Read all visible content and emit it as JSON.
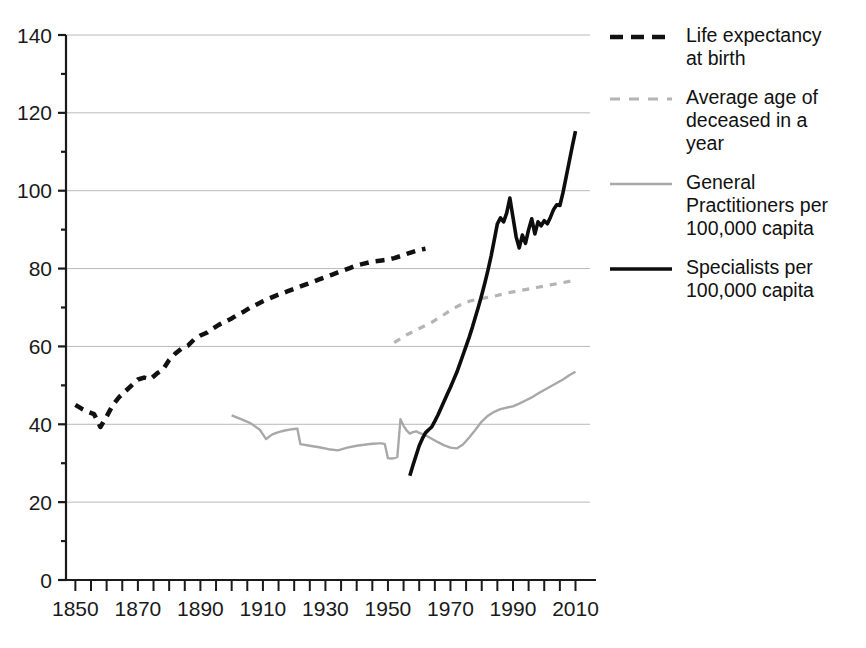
{
  "chart_data": {
    "type": "line",
    "title": "",
    "xlabel": "",
    "ylabel": "",
    "xlim": [
      1847,
      2014
    ],
    "ylim": [
      0,
      140
    ],
    "ytick_step": 20,
    "xtick_major_step": 20,
    "xtick_minor_step": 5,
    "grid": true,
    "grid_axis": "y",
    "legend_position": "right",
    "yticks": [
      "0",
      "20",
      "40",
      "60",
      "80",
      "100",
      "120",
      "140"
    ],
    "xticks": [
      "1850",
      "1870",
      "1890",
      "1910",
      "1930",
      "1950",
      "1970",
      "1990",
      "2010"
    ],
    "colors": {
      "life_expectancy": "#111111",
      "average_age_deceased": "#b4b4b4",
      "general_practitioners": "#a8a8a8",
      "specialists": "#0d0d0d",
      "gridline": "#b9b9b9",
      "axis": "#1a1a1a"
    },
    "series": [
      {
        "name": "Life expectancy at birth",
        "style": "dashed",
        "color": "#111111",
        "width": 4.5,
        "points": [
          [
            1850,
            45.0
          ],
          [
            1852,
            44.0
          ],
          [
            1854,
            43.2
          ],
          [
            1856,
            42.6
          ],
          [
            1858,
            39.3
          ],
          [
            1860,
            42.0
          ],
          [
            1862,
            45.0
          ],
          [
            1864,
            47.0
          ],
          [
            1866,
            48.5
          ],
          [
            1868,
            50.0
          ],
          [
            1870,
            51.5
          ],
          [
            1872,
            52.0
          ],
          [
            1874,
            51.6
          ],
          [
            1876,
            53.0
          ],
          [
            1878,
            54.0
          ],
          [
            1880,
            56.5
          ],
          [
            1882,
            58.2
          ],
          [
            1884,
            59.5
          ],
          [
            1886,
            60.2
          ],
          [
            1888,
            61.8
          ],
          [
            1890,
            62.8
          ],
          [
            1892,
            63.5
          ],
          [
            1894,
            64.6
          ],
          [
            1896,
            65.6
          ],
          [
            1898,
            66.4
          ],
          [
            1900,
            67.2
          ],
          [
            1902,
            68.2
          ],
          [
            1904,
            69.0
          ],
          [
            1906,
            70.0
          ],
          [
            1908,
            70.8
          ],
          [
            1910,
            71.6
          ],
          [
            1912,
            72.3
          ],
          [
            1914,
            73.0
          ],
          [
            1916,
            73.6
          ],
          [
            1918,
            74.2
          ],
          [
            1920,
            74.8
          ],
          [
            1922,
            75.4
          ],
          [
            1924,
            76.0
          ],
          [
            1926,
            76.6
          ],
          [
            1928,
            77.2
          ],
          [
            1930,
            77.8
          ],
          [
            1932,
            78.4
          ],
          [
            1934,
            79.0
          ],
          [
            1936,
            79.6
          ],
          [
            1938,
            80.2
          ],
          [
            1940,
            80.8
          ],
          [
            1942,
            81.2
          ],
          [
            1944,
            81.6
          ],
          [
            1946,
            81.9
          ],
          [
            1948,
            82.1
          ],
          [
            1950,
            82.3
          ],
          [
            1952,
            82.7
          ],
          [
            1954,
            83.2
          ],
          [
            1956,
            83.8
          ],
          [
            1958,
            84.3
          ],
          [
            1960,
            84.8
          ],
          [
            1962,
            85.1
          ]
        ]
      },
      {
        "name": "Average age of deceased in a year",
        "style": "dashed",
        "color": "#b4b4b4",
        "width": 3.2,
        "points": [
          [
            1952,
            61.0
          ],
          [
            1954,
            62.0
          ],
          [
            1956,
            63.0
          ],
          [
            1958,
            63.8
          ],
          [
            1960,
            64.6
          ],
          [
            1962,
            65.4
          ],
          [
            1964,
            66.2
          ],
          [
            1966,
            67.2
          ],
          [
            1968,
            68.2
          ],
          [
            1970,
            69.3
          ],
          [
            1972,
            70.2
          ],
          [
            1974,
            71.0
          ],
          [
            1976,
            71.6
          ],
          [
            1978,
            72.0
          ],
          [
            1980,
            72.3
          ],
          [
            1982,
            72.6
          ],
          [
            1984,
            72.9
          ],
          [
            1986,
            73.3
          ],
          [
            1988,
            73.7
          ],
          [
            1990,
            74.0
          ],
          [
            1992,
            74.3
          ],
          [
            1994,
            74.6
          ],
          [
            1996,
            74.9
          ],
          [
            1998,
            75.2
          ],
          [
            2000,
            75.5
          ],
          [
            2002,
            75.8
          ],
          [
            2004,
            76.1
          ],
          [
            2006,
            76.4
          ],
          [
            2008,
            76.7
          ],
          [
            2010,
            77.0
          ]
        ]
      },
      {
        "name": "General Practitioners per 100,000 capita",
        "style": "solid",
        "color": "#a8a8a8",
        "width": 2.4,
        "points": [
          [
            1900,
            42.3
          ],
          [
            1903,
            41.3
          ],
          [
            1906,
            40.3
          ],
          [
            1909,
            38.6
          ],
          [
            1910,
            37.4
          ],
          [
            1911,
            36.2
          ],
          [
            1913,
            37.4
          ],
          [
            1915,
            38.0
          ],
          [
            1917,
            38.4
          ],
          [
            1919,
            38.7
          ],
          [
            1920,
            38.8
          ],
          [
            1921,
            38.9
          ],
          [
            1922,
            34.9
          ],
          [
            1925,
            34.5
          ],
          [
            1928,
            34.1
          ],
          [
            1931,
            33.6
          ],
          [
            1934,
            33.3
          ],
          [
            1937,
            34.0
          ],
          [
            1940,
            34.5
          ],
          [
            1943,
            34.8
          ],
          [
            1945,
            35.0
          ],
          [
            1947,
            35.1
          ],
          [
            1948,
            35.1
          ],
          [
            1949,
            34.9
          ],
          [
            1950,
            31.3
          ],
          [
            1951,
            31.2
          ],
          [
            1952,
            31.3
          ],
          [
            1953,
            31.6
          ],
          [
            1954,
            41.3
          ],
          [
            1955,
            39.6
          ],
          [
            1956,
            38.4
          ],
          [
            1957,
            37.6
          ],
          [
            1958,
            38.0
          ],
          [
            1959,
            38.2
          ],
          [
            1960,
            37.8
          ],
          [
            1962,
            37.2
          ],
          [
            1964,
            36.3
          ],
          [
            1966,
            35.4
          ],
          [
            1968,
            34.6
          ],
          [
            1970,
            34.0
          ],
          [
            1972,
            33.8
          ],
          [
            1974,
            34.8
          ],
          [
            1976,
            36.6
          ],
          [
            1978,
            38.6
          ],
          [
            1980,
            40.7
          ],
          [
            1982,
            42.2
          ],
          [
            1984,
            43.2
          ],
          [
            1986,
            43.9
          ],
          [
            1988,
            44.3
          ],
          [
            1990,
            44.6
          ],
          [
            1992,
            45.3
          ],
          [
            1994,
            46.1
          ],
          [
            1996,
            46.9
          ],
          [
            1998,
            47.9
          ],
          [
            2000,
            48.8
          ],
          [
            2002,
            49.7
          ],
          [
            2004,
            50.6
          ],
          [
            2006,
            51.5
          ],
          [
            2008,
            52.6
          ],
          [
            2010,
            53.5
          ]
        ]
      },
      {
        "name": "Specialists per 100,000 capita",
        "style": "solid",
        "color": "#0d0d0d",
        "width": 3.6,
        "points": [
          [
            1957,
            26.8
          ],
          [
            1958,
            29.5
          ],
          [
            1959,
            32.0
          ],
          [
            1960,
            34.5
          ],
          [
            1961,
            36.3
          ],
          [
            1962,
            37.8
          ],
          [
            1963,
            38.6
          ],
          [
            1964,
            39.3
          ],
          [
            1965,
            40.8
          ],
          [
            1966,
            42.4
          ],
          [
            1967,
            44.2
          ],
          [
            1968,
            46.0
          ],
          [
            1969,
            47.8
          ],
          [
            1970,
            49.5
          ],
          [
            1971,
            51.4
          ],
          [
            1972,
            53.3
          ],
          [
            1973,
            55.5
          ],
          [
            1974,
            57.8
          ],
          [
            1975,
            60.1
          ],
          [
            1976,
            62.4
          ],
          [
            1977,
            64.9
          ],
          [
            1978,
            67.6
          ],
          [
            1979,
            70.3
          ],
          [
            1980,
            73.2
          ],
          [
            1981,
            76.3
          ],
          [
            1982,
            79.6
          ],
          [
            1983,
            83.2
          ],
          [
            1984,
            87.3
          ],
          [
            1985,
            91.5
          ],
          [
            1986,
            93.0
          ],
          [
            1987,
            92.0
          ],
          [
            1988,
            94.3
          ],
          [
            1989,
            98.1
          ],
          [
            1990,
            93.2
          ],
          [
            1991,
            88.2
          ],
          [
            1992,
            85.3
          ],
          [
            1993,
            88.6
          ],
          [
            1994,
            86.5
          ],
          [
            1995,
            90.0
          ],
          [
            1996,
            92.8
          ],
          [
            1997,
            88.9
          ],
          [
            1998,
            92.0
          ],
          [
            1999,
            91.0
          ],
          [
            2000,
            92.3
          ],
          [
            2001,
            91.5
          ],
          [
            2002,
            93.2
          ],
          [
            2003,
            95.2
          ],
          [
            2004,
            96.4
          ],
          [
            2005,
            96.2
          ],
          [
            2006,
            99.5
          ],
          [
            2007,
            103.5
          ],
          [
            2008,
            107.5
          ],
          [
            2009,
            111.5
          ],
          [
            2010,
            115.3
          ]
        ]
      }
    ]
  },
  "legend": {
    "entries": [
      {
        "label": "Life expectancy\nat birth",
        "swatch": "dashed-black-thick",
        "color": "#111111"
      },
      {
        "label": "Average age of\ndeceased in a\nyear",
        "swatch": "dashed-grey",
        "color": "#b4b4b4"
      },
      {
        "label": "General\nPractitioners per\n100,000 capita",
        "swatch": "solid-grey-thin",
        "color": "#a8a8a8"
      },
      {
        "label": "Specialists per\n100,000 capita",
        "swatch": "solid-black-thick",
        "color": "#0d0d0d"
      }
    ]
  }
}
